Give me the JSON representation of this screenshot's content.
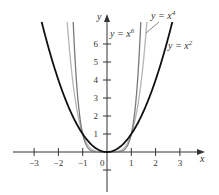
{
  "chart_data": {
    "type": "line",
    "title": "",
    "xlabel": "x",
    "ylabel": "y",
    "xlim": [
      -3.5,
      4
    ],
    "ylim": [
      -2,
      7.5
    ],
    "x_ticks": [
      -3,
      -2,
      -1,
      0,
      1,
      2,
      3
    ],
    "x_tick_labels": [
      "−3",
      "−2",
      "−1",
      "0",
      "1",
      "2",
      "3"
    ],
    "y_ticks": [
      1,
      2,
      3,
      4,
      5,
      6
    ],
    "y_tick_labels": [
      "1",
      "2",
      "3",
      "4",
      "5",
      "6"
    ],
    "grid": false,
    "series": [
      {
        "name": "y = x^2",
        "label": "y = x",
        "exponent": 2,
        "sup": "2",
        "color": "#111111",
        "width": 1.8
      },
      {
        "name": "y = x^4",
        "label": "y = x",
        "exponent": 4,
        "sup": "4",
        "color": "#b5b5b5",
        "width": 1.3
      },
      {
        "name": "y = x^6",
        "label": "y = x",
        "exponent": 6,
        "sup": "6",
        "color": "#7a7a7a",
        "width": 1.3
      }
    ],
    "annotations": [
      {
        "text": "y = x^6",
        "near": "upper-left of y-axis"
      },
      {
        "text": "y = x^4",
        "near": "top, leader line to curve"
      },
      {
        "text": "y = x^2",
        "near": "right side"
      }
    ]
  },
  "geometry": {
    "origin_x": 107,
    "origin_y": 152,
    "x_scale": 24.3,
    "y_scale": 18,
    "clip_top": 22
  }
}
